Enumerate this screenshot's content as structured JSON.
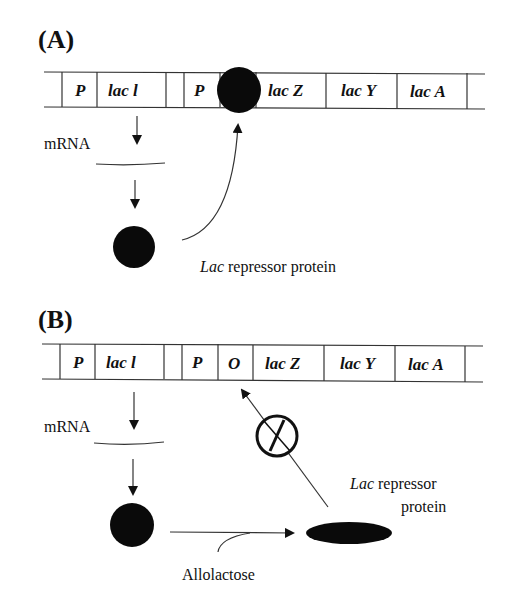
{
  "panel_a": {
    "label": "(A)",
    "segments": [
      "P",
      "lac l",
      "",
      "P",
      "",
      "lac Z",
      "lac Y",
      "lac A"
    ],
    "mrna_label": "mRNA",
    "protein_label_italic": "Lac",
    "protein_label_rest": " repressor protein"
  },
  "panel_b": {
    "label": "(B)",
    "segments": [
      "P",
      "lac l",
      "",
      "P",
      "O",
      "lac Z",
      "lac Y",
      "lac A"
    ],
    "mrna_label": "mRNA",
    "protein_label_italic": "Lac",
    "protein_label_rest": " repressor",
    "protein_label_line2": "protein",
    "inducer_label": "Allolactose",
    "blocked_symbol": "no-binding-icon"
  }
}
